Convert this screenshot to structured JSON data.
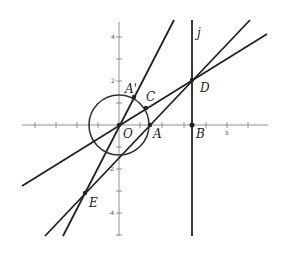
{
  "diagram": {
    "type": "coordinate-geometry",
    "axes": {
      "x_ticks": [
        -4,
        -3,
        -2,
        -1,
        1,
        2,
        3,
        4,
        5,
        6
      ],
      "y_ticks": [
        -5,
        -4,
        -3,
        -2,
        -1,
        1,
        2,
        3,
        4
      ],
      "x_tick_labels": [
        {
          "value": 5,
          "text": "5"
        }
      ],
      "y_tick_labels": [
        {
          "value": 4,
          "text": "4"
        },
        {
          "value": 2,
          "text": "2"
        },
        {
          "value": -2,
          "text": "-2"
        },
        {
          "value": -4,
          "text": "-4"
        }
      ]
    },
    "circle": {
      "center": "O",
      "radius": 1.4
    },
    "points": {
      "O": {
        "label": "O"
      },
      "A": {
        "label": "A"
      },
      "A_prime": {
        "label": "A'"
      },
      "B": {
        "label": "B"
      },
      "C": {
        "label": "C"
      },
      "D": {
        "label": "D"
      },
      "E": {
        "label": "E"
      }
    },
    "lines": {
      "j": {
        "label": "j"
      }
    }
  }
}
